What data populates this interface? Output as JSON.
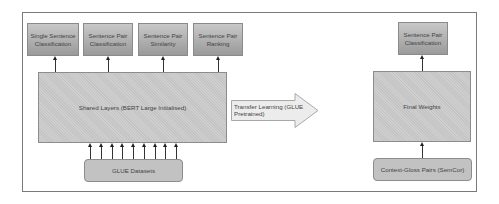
{
  "diagram": {
    "left_tasks": [
      {
        "label": "Single Sentence Classification"
      },
      {
        "label": "Sentence Pair Classification"
      },
      {
        "label": "Sentence Pair Similarity"
      },
      {
        "label": "Sentence Pair Ranking"
      }
    ],
    "shared_layers": {
      "label": "Shared Layers (BERT Large Initialised)"
    },
    "glue_datasets": {
      "label": "GLUE Datasets"
    },
    "transfer_arrow": {
      "label": "Transfer Learning (GLUE Pretrained)"
    },
    "right_task": {
      "label": "Sentence Pair Classification"
    },
    "final_weights": {
      "label": "Final Weights"
    },
    "context_gloss": {
      "label": "Context-Gloss Pairs (SemCor)"
    },
    "colors": {
      "box_fill": "#c4c4c4",
      "task_gradient_top": "#c8c8c8",
      "task_gradient_bottom": "#9a9a9a",
      "arrow_fill": "#ececec",
      "border": "#8c8c8c",
      "text": "#444444"
    }
  }
}
